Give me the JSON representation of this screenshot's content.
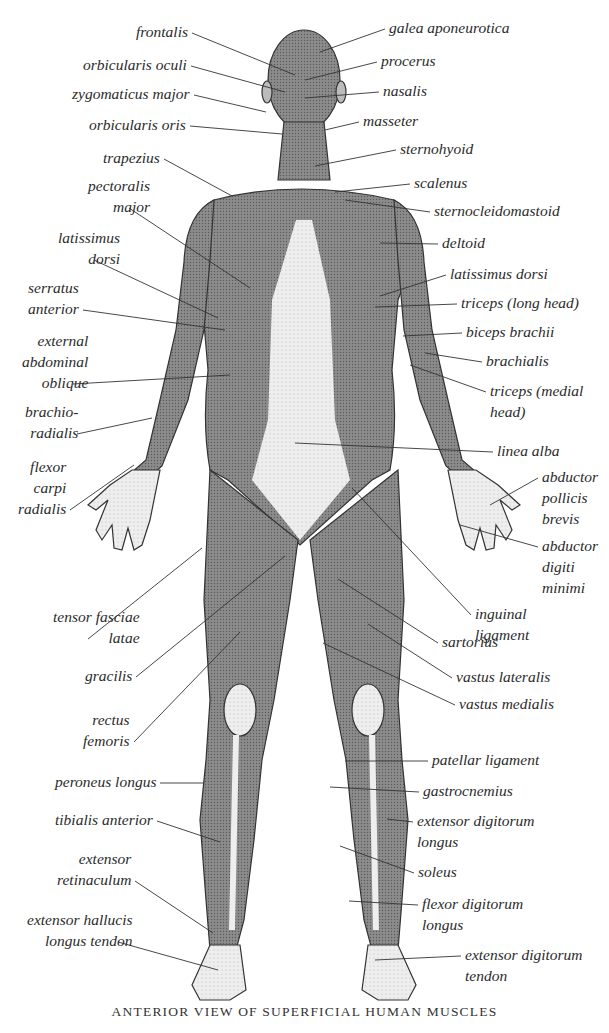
{
  "caption": "ANTERIOR VIEW OF SUPERFICIAL HUMAN MUSCLES",
  "colors": {
    "background": "#ffffff",
    "ink": "#2b2b2b",
    "muscle_dark": "#6e6e6e",
    "muscle_mid": "#9a9a9a",
    "tendon_light": "#e8e8e8"
  },
  "labels_left": [
    {
      "id": "frontalis",
      "text": "frontalis",
      "x": 136,
      "y": 21,
      "to": [
        295,
        75
      ]
    },
    {
      "id": "orbicularis-oculi",
      "text": "orbicularis oculi",
      "x": 83,
      "y": 54,
      "to": [
        285,
        92
      ]
    },
    {
      "id": "zygomaticus-major",
      "text": "zygomaticus major",
      "x": 72,
      "y": 83,
      "to": [
        266,
        112
      ]
    },
    {
      "id": "orbicularis-oris",
      "text": "orbicularis oris",
      "x": 89,
      "y": 114,
      "to": [
        282,
        134
      ]
    },
    {
      "id": "trapezius",
      "text": "trapezius",
      "x": 103,
      "y": 147,
      "to": [
        232,
        196
      ]
    },
    {
      "id": "pectoralis-major",
      "text": "pectoralis\nmajor",
      "x": 88,
      "y": 175,
      "to": [
        250,
        288
      ]
    },
    {
      "id": "latissimus-dorsi-left",
      "text": "latissimus\ndorsi",
      "x": 58,
      "y": 227,
      "to": [
        218,
        318
      ]
    },
    {
      "id": "serratus-anterior",
      "text": "serratus\nanterior",
      "x": 28,
      "y": 277,
      "to": [
        225,
        330
      ]
    },
    {
      "id": "external-abdominal-oblique",
      "text": "external\nabdominal\noblique",
      "x": 22,
      "y": 330,
      "to": [
        230,
        375
      ]
    },
    {
      "id": "brachioradialis",
      "text": "brachio-\nradialis",
      "x": 25,
      "y": 401,
      "to": [
        152,
        418
      ]
    },
    {
      "id": "flexor-carpi-radialis",
      "text": "flexor\ncarpi\nradialis",
      "x": 18,
      "y": 456,
      "to": [
        134,
        465
      ]
    },
    {
      "id": "tensor-fasciae-latae",
      "text": "tensor fasciae\nlatae",
      "x": 53,
      "y": 606,
      "to": [
        202,
        548
      ]
    },
    {
      "id": "gracilis",
      "text": "gracilis",
      "x": 85,
      "y": 665,
      "to": [
        285,
        556
      ]
    },
    {
      "id": "rectus-femoris",
      "text": "rectus\nfemoris",
      "x": 83,
      "y": 709,
      "to": [
        240,
        632
      ]
    },
    {
      "id": "peroneus-longus",
      "text": "peroneus longus",
      "x": 55,
      "y": 771,
      "to": [
        204,
        783
      ]
    },
    {
      "id": "tibialis-anterior",
      "text": "tibialis anterior",
      "x": 55,
      "y": 809,
      "to": [
        220,
        842
      ]
    },
    {
      "id": "extensor-retinaculum",
      "text": "extensor\nretinaculum",
      "x": 57,
      "y": 848,
      "to": [
        213,
        933
      ]
    },
    {
      "id": "extensor-hallucis-longus-tendon",
      "text": "extensor hallucis\nlongus tendon",
      "x": 27,
      "y": 909,
      "to": [
        218,
        970
      ]
    }
  ],
  "labels_right": [
    {
      "id": "galea-aponeurotica",
      "text": "galea aponeurotica",
      "x": 389,
      "y": 17,
      "to": [
        320,
        52
      ]
    },
    {
      "id": "procerus",
      "text": "procerus",
      "x": 381,
      "y": 50,
      "to": [
        305,
        80
      ]
    },
    {
      "id": "nasalis",
      "text": "nasalis",
      "x": 383,
      "y": 80,
      "to": [
        305,
        98
      ]
    },
    {
      "id": "masseter",
      "text": "masseter",
      "x": 363,
      "y": 110,
      "to": [
        325,
        130
      ]
    },
    {
      "id": "sternohyoid",
      "text": "sternohyoid",
      "x": 400,
      "y": 138,
      "to": [
        315,
        166
      ]
    },
    {
      "id": "scalenus",
      "text": "scalenus",
      "x": 414,
      "y": 172,
      "to": [
        335,
        192
      ]
    },
    {
      "id": "sternocleidomastoid",
      "text": "sternocleidomastoid",
      "x": 434,
      "y": 200,
      "to": [
        345,
        200
      ]
    },
    {
      "id": "deltoid",
      "text": "deltoid",
      "x": 442,
      "y": 232,
      "to": [
        380,
        243
      ]
    },
    {
      "id": "latissimus-dorsi-right",
      "text": "latissimus dorsi",
      "x": 450,
      "y": 263,
      "to": [
        380,
        296
      ]
    },
    {
      "id": "triceps-long-head",
      "text": "triceps (long head)",
      "x": 461,
      "y": 292,
      "to": [
        375,
        307
      ]
    },
    {
      "id": "biceps-brachii",
      "text": "biceps brachii",
      "x": 466,
      "y": 321,
      "to": [
        403,
        336
      ]
    },
    {
      "id": "brachialis",
      "text": "brachialis",
      "x": 486,
      "y": 350,
      "to": [
        425,
        353
      ]
    },
    {
      "id": "triceps-medial-head",
      "text": "triceps (medial\nhead)",
      "x": 490,
      "y": 380,
      "to": [
        410,
        365
      ]
    },
    {
      "id": "linea-alba",
      "text": "linea alba",
      "x": 497,
      "y": 440,
      "to": [
        295,
        443
      ]
    },
    {
      "id": "abductor-pollicis-brevis",
      "text": "abductor\npollicis\nbrevis",
      "x": 542,
      "y": 466,
      "to": [
        490,
        505
      ]
    },
    {
      "id": "abductor-digiti-minimi",
      "text": "abductor\ndigiti\nminimi",
      "x": 542,
      "y": 535,
      "to": [
        460,
        525
      ]
    },
    {
      "id": "inguinal-ligament",
      "text": "inguinal\nligament",
      "x": 475,
      "y": 603,
      "to": [
        352,
        488
      ]
    },
    {
      "id": "sartorius",
      "text": "sartorius",
      "x": 442,
      "y": 631,
      "to": [
        338,
        579
      ]
    },
    {
      "id": "vastus-lateralis",
      "text": "vastus lateralis",
      "x": 456,
      "y": 666,
      "to": [
        368,
        624
      ]
    },
    {
      "id": "vastus-medialis",
      "text": "vastus medialis",
      "x": 459,
      "y": 693,
      "to": [
        323,
        643
      ]
    },
    {
      "id": "patellar-ligament",
      "text": "patellar ligament",
      "x": 432,
      "y": 749,
      "to": [
        345,
        761
      ]
    },
    {
      "id": "gastrocnemius",
      "text": "gastrocnemius",
      "x": 423,
      "y": 780,
      "to": [
        330,
        787
      ]
    },
    {
      "id": "extensor-digitorum-longus",
      "text": "extensor digitorum\nlongus",
      "x": 417,
      "y": 810,
      "to": [
        387,
        819
      ]
    },
    {
      "id": "soleus",
      "text": "soleus",
      "x": 418,
      "y": 861,
      "to": [
        340,
        846
      ]
    },
    {
      "id": "flexor-digitorum-longus",
      "text": "flexor digitorum\nlongus",
      "x": 422,
      "y": 893,
      "to": [
        349,
        901
      ]
    },
    {
      "id": "extensor-digitorum-tendon",
      "text": "extensor digitorum\ntendon",
      "x": 465,
      "y": 944,
      "to": [
        375,
        960
      ]
    }
  ]
}
